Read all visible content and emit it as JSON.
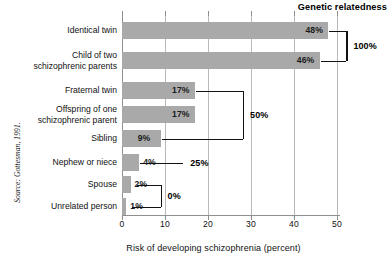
{
  "header": {
    "title": "Genetic relatedness"
  },
  "source": {
    "text": "Source: Gottesman, 1991."
  },
  "axis": {
    "x_title": "Risk of developing schizophrenia (percent)",
    "ticks": [
      "0",
      "10",
      "20",
      "30",
      "40",
      "50"
    ]
  },
  "relatedness_labels": {
    "b100": "100%",
    "b50": "50%",
    "b25": "25%",
    "b0": "0%"
  },
  "rows": [
    {
      "label": "Identical twin",
      "label2": "",
      "value_text": "48%"
    },
    {
      "label": "Child of two",
      "label2": "schizophrenic parents",
      "value_text": "46%"
    },
    {
      "label": "Fraternal twin",
      "label2": "",
      "value_text": "17%"
    },
    {
      "label": "Offspring of one",
      "label2": "schizophrenic parent",
      "value_text": "17%"
    },
    {
      "label": "Sibling",
      "label2": "",
      "value_text": "9%"
    },
    {
      "label": "Nephew or niece",
      "label2": "",
      "value_text": "4%"
    },
    {
      "label": "Spouse",
      "label2": "",
      "value_text": "2%"
    },
    {
      "label": "Unrelated person",
      "label2": "",
      "value_text": "1%"
    }
  ],
  "chart_data": {
    "type": "bar",
    "orientation": "horizontal",
    "title": "Genetic relatedness",
    "xlabel": "Risk of developing schizophrenia (percent)",
    "ylabel": "",
    "xlim": [
      0,
      50
    ],
    "xticks": [
      0,
      10,
      20,
      30,
      40,
      50
    ],
    "grid": true,
    "grid_axis": "x",
    "bar_color": "#a9a9a9",
    "categories": [
      "Identical twin",
      "Child of two schizophrenic parents",
      "Fraternal twin",
      "Offspring of one schizophrenic parent",
      "Sibling",
      "Nephew or niece",
      "Spouse",
      "Unrelated person"
    ],
    "values": [
      48,
      46,
      17,
      17,
      9,
      4,
      2,
      1
    ],
    "data_labels": [
      "48%",
      "46%",
      "17%",
      "17%",
      "9%",
      "4%",
      "2%",
      "1%"
    ],
    "annotations": [
      {
        "label": "100%",
        "groups": [
          "Identical twin",
          "Child of two schizophrenic parents"
        ]
      },
      {
        "label": "50%",
        "groups": [
          "Fraternal twin",
          "Offspring of one schizophrenic parent",
          "Sibling"
        ]
      },
      {
        "label": "25%",
        "groups": [
          "Nephew or niece"
        ]
      },
      {
        "label": "0%",
        "groups": [
          "Spouse",
          "Unrelated person"
        ]
      }
    ],
    "source": "Source: Gottesman, 1991."
  }
}
